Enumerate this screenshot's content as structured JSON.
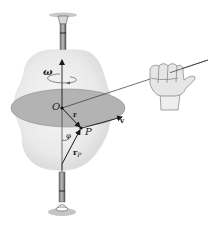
{
  "diagram": {
    "labels": {
      "omega": "ω",
      "origin": "O",
      "r": "r",
      "point": "P",
      "v": "v",
      "phi": "φ",
      "r_p_main": "r",
      "r_p_sub": "P"
    },
    "colors": {
      "body_fill": "#ececec",
      "body_shade": "#dcdcdc",
      "disc_fill": "#b3b3b3",
      "disc_stroke": "#8a8a8a",
      "axis": "#3a3a3a",
      "vector": "#1a1a1a",
      "hand_fill": "#e6e6e6",
      "hand_stroke": "#6a6a6a"
    }
  }
}
